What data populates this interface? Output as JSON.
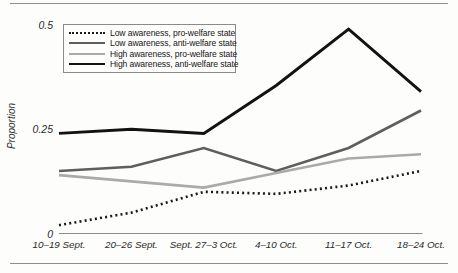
{
  "chart_data": {
    "type": "line",
    "title": "",
    "xlabel": "",
    "ylabel": "Proportion",
    "ylim": [
      0,
      0.5
    ],
    "grid": false,
    "legend_position": "upper-left-inside",
    "yticks": [
      {
        "value": 0,
        "label": "0"
      },
      {
        "value": 0.25,
        "label": "0.25"
      },
      {
        "value": 0.5,
        "label": "0.5"
      }
    ],
    "categories": [
      "10–19 Sept.",
      "20–26 Sept.",
      "Sept. 27–3 Oct.",
      "4–10 Oct.",
      "11–17 Oct.",
      "18–24 Oct."
    ],
    "series": [
      {
        "name": "Low awareness, pro-welfare state",
        "style": "dotted",
        "color": "#1a1a1a",
        "width": 2.6,
        "values": [
          0.02,
          0.05,
          0.1,
          0.095,
          0.115,
          0.15
        ]
      },
      {
        "name": "Low awareness, anti-welfare state",
        "style": "solid",
        "color": "#5e5e5e",
        "width": 2.6,
        "values": [
          0.15,
          0.16,
          0.205,
          0.15,
          0.205,
          0.295
        ]
      },
      {
        "name": "High awareness, pro-welfare state",
        "style": "solid",
        "color": "#aaaaaa",
        "width": 2.6,
        "values": [
          0.14,
          0.125,
          0.11,
          0.145,
          0.18,
          0.19
        ]
      },
      {
        "name": "High awareness, anti-welfare state",
        "style": "solid",
        "color": "#121212",
        "width": 2.9,
        "values": [
          0.24,
          0.25,
          0.24,
          0.355,
          0.49,
          0.34
        ]
      }
    ],
    "axis_color": "#8c8c8c"
  }
}
